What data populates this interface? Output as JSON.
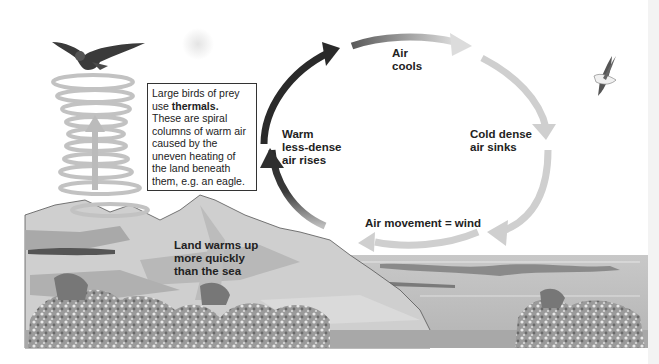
{
  "diagram": {
    "infobox": {
      "line1": "Large birds of prey",
      "line2_prefix": "use ",
      "line2_bold": "thermals.",
      "line3": "These are spiral",
      "line4": "columns of warm air",
      "line5": "caused by the",
      "line6": "uneven heating of",
      "line7": "the land beneath",
      "line8": "them, e.g. an eagle."
    },
    "labels": {
      "air_cools_1": "Air",
      "air_cools_2": "cools",
      "cold_dense_1": "Cold dense",
      "cold_dense_2": "air sinks",
      "warm_rises_1": "Warm",
      "warm_rises_2": "less-dense",
      "warm_rises_3": "air rises",
      "wind": "Air movement = wind",
      "land_1": "Land warms up",
      "land_2": "more quickly",
      "land_3": "than the sea"
    },
    "icons": [
      "eagle-icon",
      "seagull-icon",
      "sun-icon",
      "thermal-spiral-icon",
      "trees-icon"
    ],
    "colors": {
      "arrow_dark": "#2a2a2a",
      "arrow_light": "#cfcfcf",
      "land": "#c9c9c9",
      "sea": "#bdbdbd",
      "text": "#222222"
    }
  }
}
